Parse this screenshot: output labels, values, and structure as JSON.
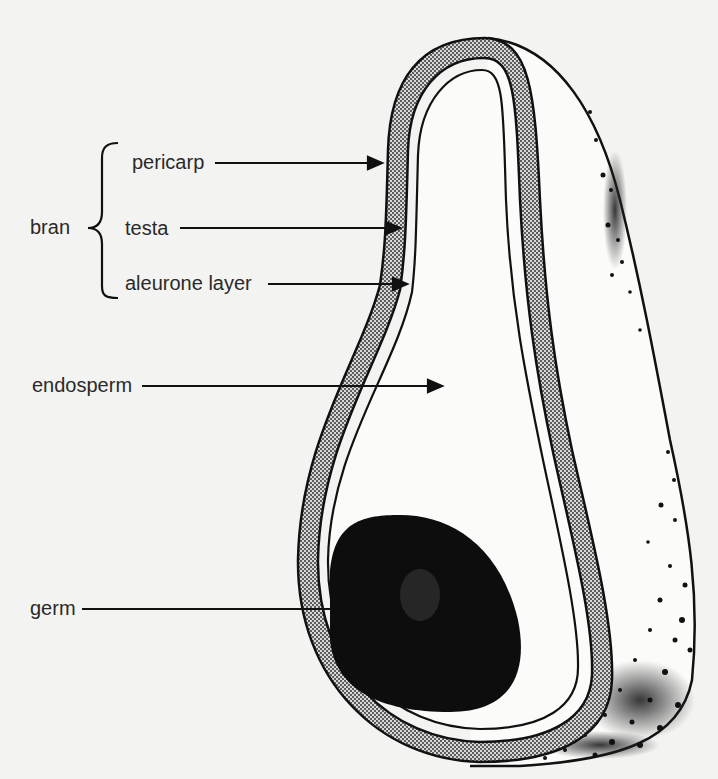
{
  "diagram": {
    "group_label": "bran",
    "labels": {
      "pericarp": "pericarp",
      "testa": "testa",
      "aleurone": "aleurone layer",
      "endosperm": "endosperm",
      "germ": "germ"
    },
    "colors": {
      "background": "#f3f3f1",
      "ink": "#111111",
      "seed_coat_fill": "#8a8a8a",
      "germ_fill": "#0d0d0d"
    }
  }
}
